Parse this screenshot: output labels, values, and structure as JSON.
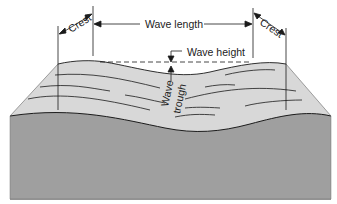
{
  "diagram": {
    "labels": {
      "crest_left": "Crest",
      "crest_right": "Crest",
      "wave_length": "Wave length",
      "wave_height": "Wave height",
      "wave_trough_line1": "Wave",
      "wave_trough_line2": "trough"
    },
    "colors": {
      "surface": "#d6d6d6",
      "body": "#9e9e9e",
      "line": "#1a1a1a"
    }
  }
}
